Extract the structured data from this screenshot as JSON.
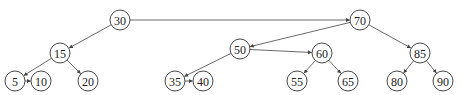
{
  "diagram": {
    "type": "tree-with-level-links",
    "node_radius": 10,
    "nodes": [
      {
        "id": "n30",
        "label": "30",
        "x": 120,
        "y": 20
      },
      {
        "id": "n70",
        "label": "70",
        "x": 360,
        "y": 20
      },
      {
        "id": "n15",
        "label": "15",
        "x": 60,
        "y": 53
      },
      {
        "id": "n50",
        "label": "50",
        "x": 240,
        "y": 49
      },
      {
        "id": "n60",
        "label": "60",
        "x": 322,
        "y": 53
      },
      {
        "id": "n85",
        "label": "85",
        "x": 420,
        "y": 53
      },
      {
        "id": "n5",
        "label": "5",
        "x": 15,
        "y": 81
      },
      {
        "id": "n10",
        "label": "10",
        "x": 41,
        "y": 81
      },
      {
        "id": "n20",
        "label": "20",
        "x": 88,
        "y": 81
      },
      {
        "id": "n35",
        "label": "35",
        "x": 175,
        "y": 81
      },
      {
        "id": "n40",
        "label": "40",
        "x": 203,
        "y": 81
      },
      {
        "id": "n55",
        "label": "55",
        "x": 297,
        "y": 81
      },
      {
        "id": "n65",
        "label": "65",
        "x": 348,
        "y": 81
      },
      {
        "id": "n80",
        "label": "80",
        "x": 397,
        "y": 81
      },
      {
        "id": "n90",
        "label": "90",
        "x": 443,
        "y": 81
      }
    ],
    "edges": [
      {
        "from": "n30",
        "to": "n70"
      },
      {
        "from": "n30",
        "to": "n15"
      },
      {
        "from": "n70",
        "to": "n50"
      },
      {
        "from": "n70",
        "to": "n85"
      },
      {
        "from": "n50",
        "to": "n60"
      },
      {
        "from": "n50",
        "to": "n35"
      },
      {
        "from": "n15",
        "to": "n5"
      },
      {
        "from": "n15",
        "to": "n20"
      },
      {
        "from": "n5",
        "to": "n10"
      },
      {
        "from": "n35",
        "to": "n40"
      },
      {
        "from": "n60",
        "to": "n55"
      },
      {
        "from": "n60",
        "to": "n65"
      },
      {
        "from": "n85",
        "to": "n80"
      },
      {
        "from": "n85",
        "to": "n90"
      }
    ],
    "colors": {
      "stroke": "#333333",
      "fill": "#ffffff",
      "text": "#222222"
    }
  }
}
